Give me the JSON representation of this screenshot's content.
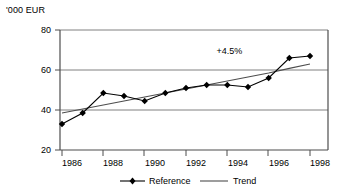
{
  "chart_data": {
    "type": "line",
    "title": "",
    "subtitle": "",
    "ylabel": "'000 EUR",
    "xlabel": "",
    "categories": [
      1986,
      1987,
      1988,
      1989,
      1990,
      1991,
      1992,
      1993,
      1994,
      1995,
      1996,
      1997,
      1998
    ],
    "xtick_labels": [
      "1986",
      "1988",
      "1990",
      "1992",
      "1994",
      "1996",
      "1998"
    ],
    "xtick_values": [
      1986,
      1988,
      1990,
      1992,
      1994,
      1996,
      1998
    ],
    "ytick_labels": [
      "20",
      "40",
      "60",
      "80"
    ],
    "ytick_values": [
      20,
      40,
      60,
      80
    ],
    "ylim": [
      20,
      80
    ],
    "xlim": [
      1985.5,
      1998.5
    ],
    "grid": "horizontal",
    "legend_position": "bottom",
    "series": [
      {
        "name": "Reference",
        "marker": "diamond",
        "color": "#000000",
        "values": [
          33,
          38.5,
          48.5,
          47,
          44.5,
          48.5,
          51,
          52.5,
          52.5,
          51.5,
          56,
          66,
          67
        ]
      },
      {
        "name": "Trend",
        "marker": "none",
        "color": "#4d4d4d",
        "values": [
          38.5,
          40.5,
          42.5,
          44.5,
          46.5,
          48.5,
          50.5,
          52.5,
          54.5,
          56.5,
          58.5,
          60.8,
          63
        ]
      }
    ],
    "annotations": [
      {
        "text": "+4.5%",
        "x": 1994.1,
        "y": 69.5
      }
    ],
    "axis_color": "#4d4d4d",
    "grid_color": "#808080",
    "background": "#ffffff"
  }
}
